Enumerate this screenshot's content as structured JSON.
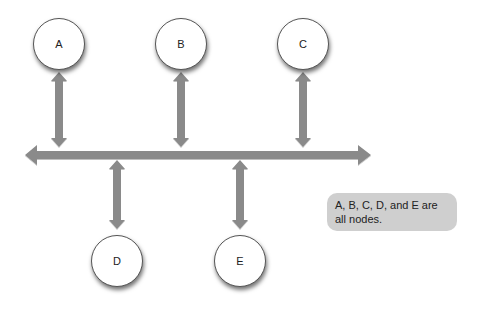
{
  "diagram": {
    "type": "bus-topology",
    "colors": {
      "connector": "#8a8a8a",
      "node_fill": "#ffffff",
      "node_border": "#555555",
      "note_fill": "#cfcfcf"
    },
    "nodes": [
      {
        "id": "A",
        "label": "A",
        "position": "top"
      },
      {
        "id": "B",
        "label": "B",
        "position": "top"
      },
      {
        "id": "C",
        "label": "C",
        "position": "top"
      },
      {
        "id": "D",
        "label": "D",
        "position": "bottom"
      },
      {
        "id": "E",
        "label": "E",
        "position": "bottom"
      }
    ],
    "bus": {
      "label": "",
      "bidirectional": true
    },
    "note": {
      "text": "A, B, C, D, and E are all nodes."
    }
  }
}
